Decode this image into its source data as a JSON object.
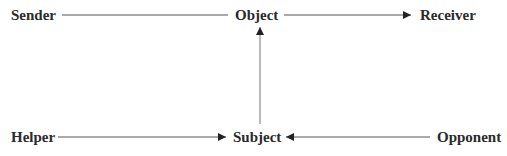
{
  "diagram": {
    "type": "actantial-model",
    "nodes": {
      "sender": {
        "label": "Sender"
      },
      "object": {
        "label": "Object"
      },
      "receiver": {
        "label": "Receiver"
      },
      "helper": {
        "label": "Helper"
      },
      "subject": {
        "label": "Subject"
      },
      "opponent": {
        "label": "Opponent"
      }
    },
    "edges": [
      {
        "from": "Sender",
        "to": "Object",
        "arrow": false
      },
      {
        "from": "Object",
        "to": "Receiver",
        "arrow": true
      },
      {
        "from": "Subject",
        "to": "Object",
        "arrow": true
      },
      {
        "from": "Helper",
        "to": "Subject",
        "arrow": true
      },
      {
        "from": "Opponent",
        "to": "Subject",
        "arrow": true
      }
    ],
    "colors": {
      "text": "#2a2a2a",
      "line": "#555555",
      "arrowhead": "#222222"
    }
  }
}
